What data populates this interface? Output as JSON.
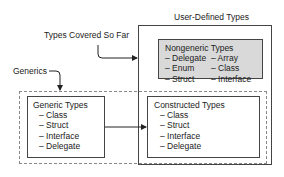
{
  "user_defined": {
    "title": "User-Defined Types"
  },
  "nongeneric": {
    "title": "Nongeneric Types",
    "items": [
      "– Delegate",
      "– Array",
      "– Enum",
      "– Class",
      "– Struct",
      "– Interface"
    ]
  },
  "callouts": {
    "types_covered": "Types Covered So Far",
    "generics": "Generics"
  },
  "generic_types": {
    "title": "Generic Types",
    "items": [
      "– Class",
      "– Struct",
      "– Interface",
      "– Delegate"
    ]
  },
  "constructed_types": {
    "title": "Constructed Types",
    "items": [
      "– Class",
      "– Struct",
      "– Interface",
      "– Delegate"
    ]
  }
}
